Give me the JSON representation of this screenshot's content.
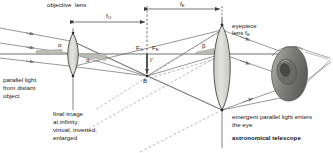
{
  "diagram": {
    "title": "astronomical telescope"
  },
  "labels": {
    "objective_lens": "objective  lens",
    "f_objective": "f",
    "f_objective_sub": "O",
    "f_eyepiece": "f",
    "f_eyepiece_sub": "E",
    "eyepiece_lens_line1": "eyepiece",
    "eyepiece_lens_line2": "lens f",
    "eyepiece_lens_line2_sub": "E",
    "focal_point_objective": "F",
    "focal_point_objective_sub": "O",
    "focal_point_eyepiece": "F",
    "focal_point_eyepiece_sub": "E",
    "intermediate_image": "I'",
    "image_point": "B",
    "angle_alpha_in": "α",
    "angle_alpha_out": "α",
    "angle_beta": "β",
    "parallel_light_line1": "parallel light",
    "parallel_light_line2": "from distant",
    "parallel_light_line3": "object",
    "final_image_line1": "final image",
    "final_image_line2": "at infinity:",
    "final_image_line3": "virtual, inverted,",
    "final_image_line4": "enlarged",
    "emergent_line1": "emergent parallel light enters",
    "emergent_line2": "the eye",
    "telescope_name": "astronomical telescope"
  },
  "colors": {
    "ray": "#6b6b6b",
    "axis": "#4d4d4d",
    "lens_fill": "#d7d7d2",
    "lens_stroke": "#3c3c3c",
    "dimension": "#3a3a3a",
    "dashed": "#8a8a8a",
    "angle_wedge": "#b8b8b3",
    "eye_outer": "#9d9d98",
    "eye_iris": "#6e6e69",
    "eye_pupil": "#4a4a46",
    "text": "#141414"
  },
  "geometry": {
    "axis_y": 54,
    "objective_x": 73,
    "eyepiece_x": 222,
    "focal_x": 147,
    "image_point_b": {
      "x": 147,
      "y": 76
    },
    "f_objective_span": [
      73,
      147
    ],
    "f_eyepiece_span": [
      147,
      222
    ]
  }
}
